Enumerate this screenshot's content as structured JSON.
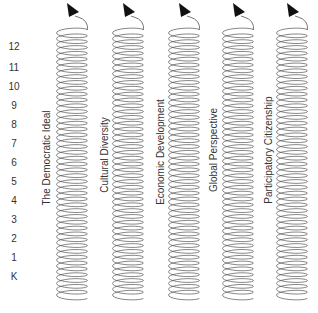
{
  "diagram": {
    "type": "spiral-curriculum",
    "grade_levels": [
      "12",
      "11",
      "10",
      "9",
      "8",
      "7",
      "6",
      "5",
      "4",
      "3",
      "2",
      "1",
      "K"
    ],
    "strands": [
      {
        "label": "The Democratic Ideal",
        "spiral_center_x": 72,
        "label_x": 46,
        "label_y": 158
      },
      {
        "label": "Cultural Diversity",
        "spiral_center_x": 128,
        "label_x": 104,
        "label_y": 155
      },
      {
        "label": "Economic Development",
        "spiral_center_x": 184,
        "label_x": 160,
        "label_y": 152
      },
      {
        "label": "Global Perspective",
        "spiral_center_x": 238,
        "label_x": 213,
        "label_y": 150
      },
      {
        "label": "Participatory Citizenship",
        "spiral_center_x": 292,
        "label_x": 268,
        "label_y": 150
      }
    ],
    "colors": {
      "line": "#555555",
      "arrow": "#111111",
      "text": "#333333"
    }
  }
}
